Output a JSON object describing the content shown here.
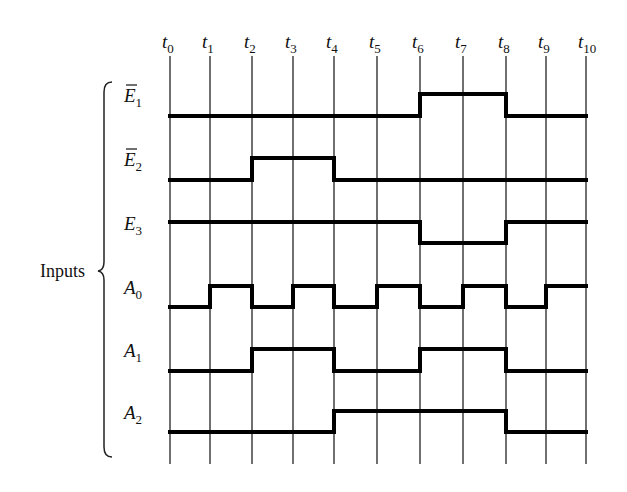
{
  "diagram": {
    "type": "timing-diagram",
    "group_label": "Inputs",
    "time_labels": [
      {
        "base": "t",
        "sub": "0"
      },
      {
        "base": "t",
        "sub": "1"
      },
      {
        "base": "t",
        "sub": "2"
      },
      {
        "base": "t",
        "sub": "3"
      },
      {
        "base": "t",
        "sub": "4"
      },
      {
        "base": "t",
        "sub": "5"
      },
      {
        "base": "t",
        "sub": "6"
      },
      {
        "base": "t",
        "sub": "7"
      },
      {
        "base": "t",
        "sub": "8"
      },
      {
        "base": "t",
        "sub": "9"
      },
      {
        "base": "t",
        "sub": "10"
      }
    ],
    "signals": [
      {
        "name": "E1_bar",
        "base": "E",
        "sub": "1",
        "overbar": true,
        "levels": [
          0,
          0,
          0,
          0,
          0,
          0,
          1,
          1,
          0,
          0
        ]
      },
      {
        "name": "E2_bar",
        "base": "E",
        "sub": "2",
        "overbar": true,
        "levels": [
          0,
          0,
          1,
          1,
          0,
          0,
          0,
          0,
          0,
          0
        ]
      },
      {
        "name": "E3",
        "base": "E",
        "sub": "3",
        "overbar": false,
        "levels": [
          1,
          1,
          1,
          1,
          1,
          1,
          0,
          0,
          1,
          1
        ]
      },
      {
        "name": "A0",
        "base": "A",
        "sub": "0",
        "overbar": false,
        "levels": [
          0,
          1,
          0,
          1,
          0,
          1,
          0,
          1,
          0,
          1
        ]
      },
      {
        "name": "A1",
        "base": "A",
        "sub": "1",
        "overbar": false,
        "levels": [
          0,
          0,
          1,
          1,
          0,
          0,
          1,
          1,
          0,
          0
        ]
      },
      {
        "name": "A2",
        "base": "A",
        "sub": "2",
        "overbar": false,
        "levels": [
          0,
          0,
          0,
          0,
          1,
          1,
          1,
          1,
          0,
          0
        ]
      }
    ],
    "colors": {
      "line": "#000000",
      "grid": "#222222",
      "background": "#ffffff"
    }
  }
}
